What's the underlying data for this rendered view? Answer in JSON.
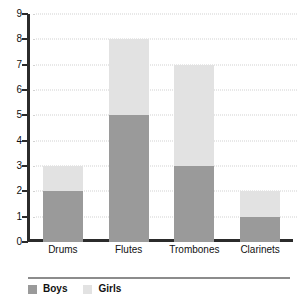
{
  "chart_data": {
    "type": "bar",
    "subtype": "stacked-bar",
    "title": "",
    "xlabel": "",
    "ylabel": "",
    "categories": [
      "Drums",
      "Flutes",
      "Trombones",
      "Clarinets"
    ],
    "series": [
      {
        "name": "Boys",
        "color": "#9a9a9a",
        "values": [
          2,
          5,
          3,
          1
        ]
      },
      {
        "name": "Girls",
        "color": "#e2e2e2",
        "values": [
          1,
          3,
          4,
          1
        ]
      }
    ],
    "totals": [
      3,
      8,
      7,
      2
    ],
    "ylim": [
      0,
      9
    ],
    "ytick_step": 1,
    "yticks": [
      0,
      1,
      2,
      3,
      4,
      5,
      6,
      7,
      8,
      9
    ],
    "ytick_labels": [
      "0",
      "1",
      "2",
      "3",
      "4",
      "5",
      "6",
      "7",
      "8",
      "9"
    ],
    "grid": true,
    "grid_style": "dotted",
    "grid_color": "#d2d2d2",
    "legend_position": "bottom-left",
    "axis_color": "#2b2b2b",
    "background": "#ffffff"
  },
  "legend": {
    "items": [
      {
        "label": "Boys",
        "color": "#9a9a9a"
      },
      {
        "label": "Girls",
        "color": "#e2e2e2"
      }
    ]
  }
}
